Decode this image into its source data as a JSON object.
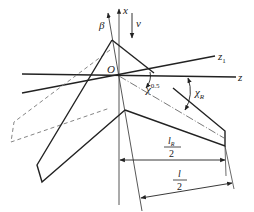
{
  "diagram": {
    "type": "swept-wing-geometry",
    "labels": {
      "x_axis": "x",
      "beta_axis": "β",
      "velocity": "v",
      "origin": "O",
      "z_axis": "z",
      "z1_axis": "z",
      "z1_sub": "1",
      "chi_half": "χ",
      "chi_half_sup": "0.5",
      "chi_R": "χ",
      "chi_R_sub": "R",
      "lR_num": "l",
      "lR_sub": "R",
      "lR_den": "2",
      "l_num": "l",
      "l_den": "2"
    },
    "colors": {
      "stroke": "#222222",
      "thin": "#444444",
      "dashed": "#777777",
      "background": "#ffffff"
    }
  }
}
